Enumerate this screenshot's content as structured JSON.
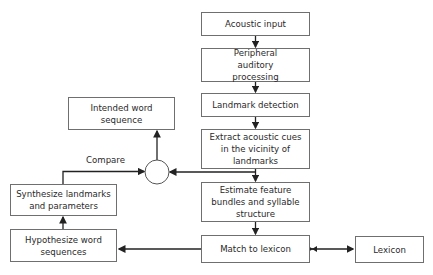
{
  "diagram": {
    "nodes": {
      "acoustic_input": "Acoustic input",
      "peripheral": "Peripheral auditory processing",
      "landmark_detection": "Landmark detection",
      "extract_cues": "Extract acoustic cues in the vicinity of landmarks",
      "estimate_features": "Estimate feature bundles and syllable structure",
      "match_lexicon": "Match to lexicon",
      "lexicon": "Lexicon",
      "hypothesize": "Hypothesize word sequences",
      "synthesize": "Synthesize landmarks and parameters",
      "intended": "Intended word sequence"
    },
    "labels": {
      "compare": "Compare"
    },
    "edges": [
      [
        "acoustic_input",
        "peripheral"
      ],
      [
        "peripheral",
        "landmark_detection"
      ],
      [
        "landmark_detection",
        "extract_cues"
      ],
      [
        "extract_cues",
        "estimate_features"
      ],
      [
        "extract_cues",
        "compare_node"
      ],
      [
        "estimate_features",
        "match_lexicon"
      ],
      [
        "match_lexicon",
        "lexicon",
        "bidirectional"
      ],
      [
        "match_lexicon",
        "hypothesize"
      ],
      [
        "hypothesize",
        "synthesize"
      ],
      [
        "synthesize",
        "compare_node"
      ],
      [
        "compare_node",
        "intended"
      ]
    ]
  }
}
